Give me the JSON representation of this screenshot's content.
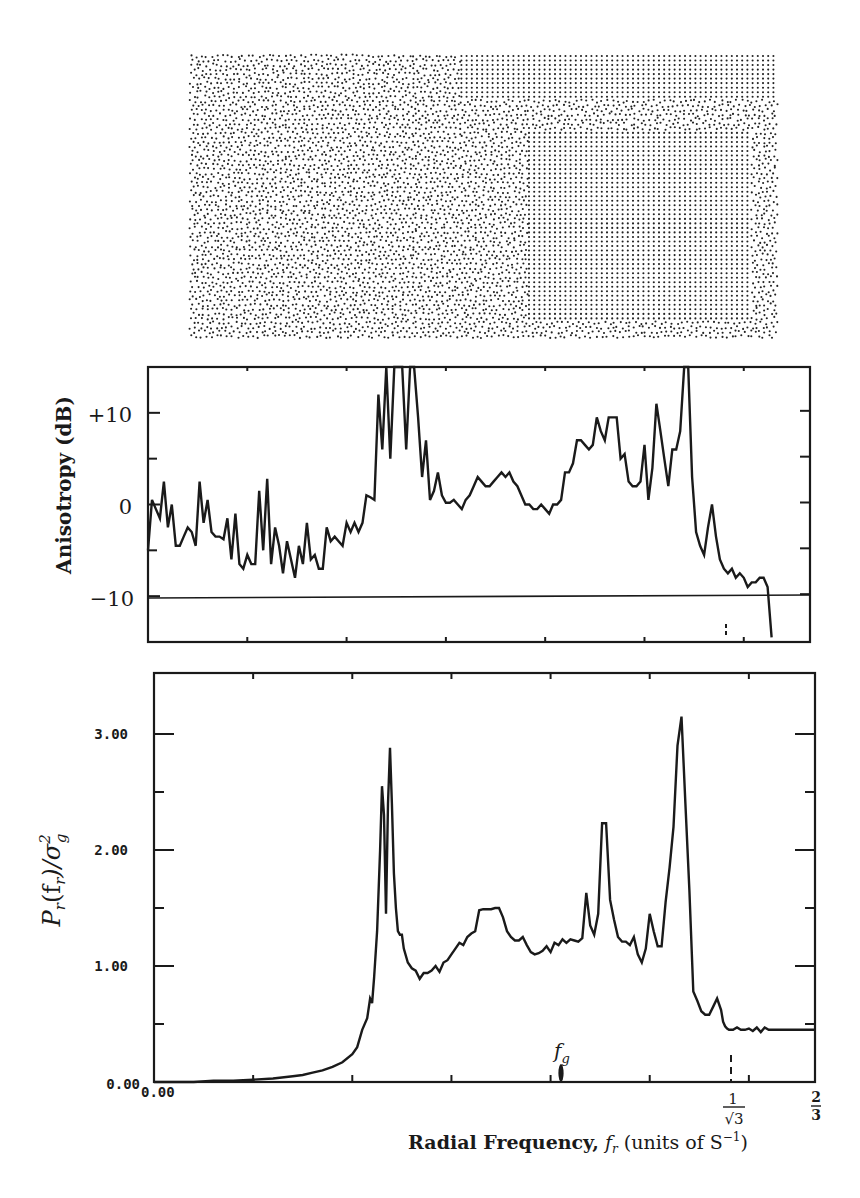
{
  "figure": {
    "point_pattern": {
      "description": "Stippled dot pattern (blue-noise point distribution with ordered regions)",
      "x": 191,
      "y": 56,
      "width": 586,
      "height": 284
    },
    "anisotropy_panel": {
      "ylabel": "Anisotropy (dB)",
      "ytick_labels": [
        "+10",
        "0",
        "−10"
      ],
      "reference_line_label": "-10 dB"
    },
    "power_panel": {
      "ylabel_main": "P",
      "ylabel_sub": "r",
      "ylabel_rest": "(f",
      "ylabel_rest_sub": "r",
      "ylabel_tail": ")/σ",
      "ylabel_sup": "2",
      "ylabel_tail_sub": "g",
      "ytick_labels": [
        "3.00",
        "2.00",
        "1.00",
        "0.00"
      ],
      "xtick_origin_label": "0.00",
      "fg_label": "f",
      "fg_sub": "g",
      "x_marker_1_num": "1",
      "x_marker_1_den": "√3",
      "x_marker_2_num": "2",
      "x_marker_2_den": "3"
    },
    "xlabel_bold": "Radial Frequency,",
    "xlabel_var": "f",
    "xlabel_var_sub": "r",
    "xlabel_units": "(units of S",
    "xlabel_units_sup": "−1",
    "xlabel_units_close": ")",
    "caption_partial": "... for the Stucco ... and Area Filter ..."
  },
  "chart_data": [
    {
      "type": "line",
      "title": "",
      "xlabel": "Radial Frequency, f_r (units of S^-1)",
      "ylabel": "Anisotropy (dB)",
      "xlim": [
        0,
        0.6667
      ],
      "ylim": [
        -15,
        15
      ],
      "yticks": [
        10,
        0,
        -10
      ],
      "reference_lines": [
        {
          "y": -10,
          "style": "solid"
        }
      ],
      "x_markers": [
        {
          "x": 0.577,
          "label": "1/√3",
          "style": "dashed"
        }
      ],
      "grid": false,
      "series": [
        {
          "name": "Anisotropy",
          "x": [
            0.0,
            0.004,
            0.008,
            0.012,
            0.016,
            0.02,
            0.024,
            0.028,
            0.032,
            0.036,
            0.04,
            0.044,
            0.048,
            0.052,
            0.056,
            0.06,
            0.064,
            0.068,
            0.072,
            0.076,
            0.08,
            0.084,
            0.088,
            0.092,
            0.096,
            0.1,
            0.104,
            0.108,
            0.112,
            0.116,
            0.12,
            0.124,
            0.128,
            0.132,
            0.136,
            0.14,
            0.144,
            0.148,
            0.152,
            0.156,
            0.16,
            0.164,
            0.168,
            0.172,
            0.176,
            0.18,
            0.184,
            0.188,
            0.192,
            0.196,
            0.2,
            0.204,
            0.208,
            0.212,
            0.216,
            0.22,
            0.224,
            0.228,
            0.232,
            0.236,
            0.24,
            0.244,
            0.248,
            0.252,
            0.256,
            0.26,
            0.264,
            0.268,
            0.272,
            0.276,
            0.28,
            0.284,
            0.288,
            0.292,
            0.296,
            0.3,
            0.304,
            0.308,
            0.312,
            0.316,
            0.32,
            0.324,
            0.328,
            0.332,
            0.336,
            0.34,
            0.344,
            0.348,
            0.352,
            0.356,
            0.36,
            0.364,
            0.368,
            0.372,
            0.376,
            0.38,
            0.384,
            0.388,
            0.392,
            0.396,
            0.4,
            0.404,
            0.408,
            0.412,
            0.416,
            0.42,
            0.424,
            0.428,
            0.432,
            0.436,
            0.44,
            0.444,
            0.448,
            0.452,
            0.456,
            0.46,
            0.464,
            0.468,
            0.472,
            0.476,
            0.48,
            0.484,
            0.488,
            0.492,
            0.496,
            0.5,
            0.504,
            0.508,
            0.512,
            0.516,
            0.52,
            0.524,
            0.528,
            0.532,
            0.536,
            0.54,
            0.544,
            0.548,
            0.552,
            0.556,
            0.56,
            0.564,
            0.568,
            0.572,
            0.576,
            0.58,
            0.584,
            0.588,
            0.592,
            0.596,
            0.6,
            0.604,
            0.608,
            0.612,
            0.616,
            0.62,
            0.624,
            0.628,
            0.632,
            0.636,
            0.64,
            0.644,
            0.648,
            0.652,
            0.656,
            0.66,
            0.664,
            0.667
          ],
          "y": [
            -5,
            0.5,
            -0.5,
            -1.5,
            2.5,
            -2.5,
            0,
            -4.5,
            -4.5,
            -3.5,
            -2.5,
            -3,
            -4.5,
            2.5,
            -2,
            0.5,
            -3,
            -3.5,
            -3.5,
            -3.8,
            -1.5,
            -6,
            -1,
            -6.5,
            -7,
            -5.5,
            -6.5,
            -6.5,
            1.5,
            -5,
            2.8,
            -6.5,
            -2.5,
            -4.5,
            -7.5,
            -4,
            -6,
            -8,
            -4.5,
            -6.5,
            -2,
            -6,
            -5.5,
            -7,
            -7,
            -2.5,
            -4,
            -3.5,
            -4,
            -4.5,
            -2,
            -3,
            -2,
            -3,
            -2,
            1,
            0.8,
            0.5,
            12,
            6,
            15,
            5,
            15,
            15,
            15,
            6,
            15,
            15,
            9.5,
            3,
            7,
            0.5,
            1.5,
            3.5,
            1,
            0.2,
            0.2,
            0.5,
            0,
            -0.5,
            0.5,
            1,
            2,
            3,
            2.5,
            2,
            2,
            2.5,
            3,
            3.5,
            3,
            3.5,
            2.5,
            2,
            1,
            0,
            0,
            -0.5,
            -0.5,
            0,
            -0.5,
            -1,
            0,
            0,
            0.5,
            3.5,
            3.5,
            4.5,
            7,
            7,
            6.5,
            6,
            6.5,
            9.5,
            8,
            7,
            9.5,
            9.5,
            9.5,
            5,
            5.5,
            2.5,
            2,
            2,
            2.5,
            6.5,
            0.5,
            4,
            11,
            8,
            5,
            2,
            6,
            6,
            8,
            15,
            15,
            3,
            -3,
            -4.5,
            -5.5,
            -2.5,
            0,
            -3.5,
            -6,
            -7,
            -7.5,
            -7,
            -8,
            -7.5,
            -8,
            -9,
            -8.5,
            -8.5,
            -8,
            -8,
            -9,
            -14.5
          ],
          "notes": "Values clipped at +15 dB (top of frame) near f≈0.24-0.26 and at f≈0.577"
        }
      ]
    },
    {
      "type": "line",
      "title": "",
      "xlabel": "Radial Frequency, f_r (units of S^-1)",
      "ylabel": "P_r(f_r)/σ_g^2",
      "xlim": [
        0,
        0.6667
      ],
      "ylim": [
        0,
        3.5
      ],
      "yticks": [
        0,
        1,
        2,
        3
      ],
      "ytick_labels": [
        "0.00",
        "1.00",
        "2.00",
        "3.00"
      ],
      "xtick_labels": [
        {
          "x": 0,
          "label": "0.00"
        },
        {
          "x": 0.577,
          "label": "1/√3"
        },
        {
          "x": 0.6667,
          "label": "2/3"
        }
      ],
      "annotations": [
        {
          "x": 0.408,
          "label": "f_g",
          "style": "arrow marker"
        }
      ],
      "grid": false,
      "series": [
        {
          "name": "Radially averaged power spectrum",
          "x": [
            0.0,
            0.02,
            0.04,
            0.06,
            0.08,
            0.1,
            0.12,
            0.14,
            0.15,
            0.16,
            0.17,
            0.18,
            0.19,
            0.2,
            0.205,
            0.21,
            0.215,
            0.218,
            0.22,
            0.222,
            0.225,
            0.228,
            0.23,
            0.232,
            0.234,
            0.236,
            0.238,
            0.24,
            0.242,
            0.244,
            0.246,
            0.248,
            0.25,
            0.252,
            0.256,
            0.26,
            0.264,
            0.268,
            0.272,
            0.276,
            0.28,
            0.284,
            0.288,
            0.292,
            0.296,
            0.3,
            0.304,
            0.308,
            0.312,
            0.316,
            0.32,
            0.324,
            0.328,
            0.332,
            0.336,
            0.34,
            0.344,
            0.348,
            0.352,
            0.356,
            0.36,
            0.364,
            0.368,
            0.372,
            0.376,
            0.38,
            0.384,
            0.388,
            0.392,
            0.396,
            0.4,
            0.404,
            0.408,
            0.412,
            0.416,
            0.42,
            0.424,
            0.428,
            0.432,
            0.436,
            0.44,
            0.444,
            0.448,
            0.452,
            0.456,
            0.46,
            0.464,
            0.468,
            0.472,
            0.476,
            0.48,
            0.484,
            0.488,
            0.492,
            0.496,
            0.5,
            0.504,
            0.508,
            0.512,
            0.516,
            0.52,
            0.524,
            0.528,
            0.532,
            0.536,
            0.54,
            0.544,
            0.548,
            0.552,
            0.556,
            0.56,
            0.564,
            0.568,
            0.572,
            0.574,
            0.576,
            0.578,
            0.58,
            0.582,
            0.584,
            0.588,
            0.592,
            0.596,
            0.6,
            0.604,
            0.608,
            0.612,
            0.616,
            0.62,
            0.624,
            0.628,
            0.632,
            0.636,
            0.64,
            0.644,
            0.648,
            0.652,
            0.656,
            0.66,
            0.664,
            0.667
          ],
          "y": [
            0.0,
            0.0,
            0.0,
            0.01,
            0.01,
            0.02,
            0.03,
            0.05,
            0.06,
            0.08,
            0.1,
            0.13,
            0.17,
            0.24,
            0.3,
            0.45,
            0.55,
            0.72,
            0.68,
            0.9,
            1.3,
            2.0,
            2.55,
            2.3,
            1.45,
            2.4,
            2.88,
            2.4,
            1.8,
            1.5,
            1.3,
            1.27,
            1.27,
            1.15,
            1.03,
            0.98,
            0.96,
            0.89,
            0.94,
            0.94,
            0.96,
            1.0,
            0.95,
            1.03,
            1.05,
            1.1,
            1.15,
            1.2,
            1.18,
            1.25,
            1.28,
            1.3,
            1.48,
            1.49,
            1.49,
            1.49,
            1.5,
            1.5,
            1.42,
            1.3,
            1.25,
            1.22,
            1.22,
            1.25,
            1.18,
            1.12,
            1.1,
            1.11,
            1.13,
            1.17,
            1.12,
            1.2,
            1.18,
            1.23,
            1.2,
            1.23,
            1.22,
            1.21,
            1.24,
            1.63,
            1.35,
            1.27,
            1.45,
            2.23,
            2.23,
            1.57,
            1.4,
            1.25,
            1.21,
            1.21,
            1.18,
            1.25,
            1.1,
            1.03,
            1.15,
            1.45,
            1.3,
            1.17,
            1.17,
            1.55,
            1.85,
            2.2,
            2.9,
            3.15,
            2.4,
            1.65,
            0.78,
            0.7,
            0.61,
            0.58,
            0.58,
            0.65,
            0.72,
            0.62,
            0.52,
            0.48,
            0.46,
            0.45,
            0.45,
            0.45,
            0.47,
            0.45,
            0.45,
            0.46,
            0.44,
            0.47,
            0.43,
            0.47,
            0.45,
            0.45,
            0.45,
            0.45,
            0.45,
            0.45,
            0.45,
            0.45,
            0.45,
            0.45,
            0.45,
            0.45,
            0.45
          ],
          "notes": "Sharp peaks near f≈0.235 (≈2.9) and f≈0.577 (≈3.15); secondary peak ≈2.23 near f≈0.46"
        }
      ]
    }
  ]
}
